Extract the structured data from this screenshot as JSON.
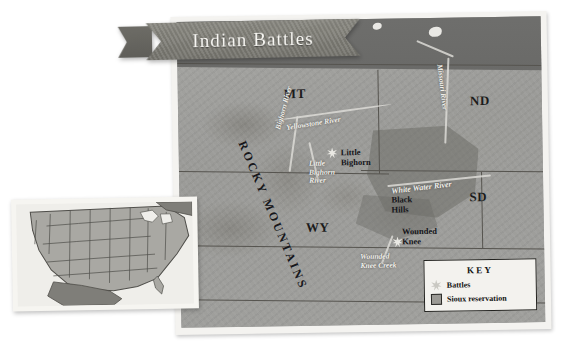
{
  "title": {
    "text": "Indian Battles"
  },
  "map": {
    "states": [
      {
        "name": "MT",
        "label": "MT"
      },
      {
        "name": "ND",
        "label": "ND"
      },
      {
        "name": "SD",
        "label": "SD"
      },
      {
        "name": "WY",
        "label": "WY"
      }
    ],
    "rivers": [
      {
        "name": "yellowstone",
        "label": "Yellowstone River"
      },
      {
        "name": "bighorn",
        "label": "Bighorn River"
      },
      {
        "name": "little-bighorn",
        "label": "Little\nBighorn\nRiver"
      },
      {
        "name": "missouri",
        "label": "Missouri River"
      },
      {
        "name": "white-water",
        "label": "White Water River"
      },
      {
        "name": "wounded-knee-creek",
        "label": "Wounded\nKnee Creek"
      }
    ],
    "places": [
      {
        "name": "little-bighorn",
        "label": "Little\nBighorn"
      },
      {
        "name": "black-hills",
        "label": "Black\nHills"
      },
      {
        "name": "wounded-knee",
        "label": "Wounded\nKnee"
      }
    ],
    "range": {
      "label": "ROCKY MOUNTAINS"
    },
    "colors": {
      "terrain": "#9b9b98",
      "canada": "#6f6f6d",
      "river": "#dcdbd6",
      "reservation": "#6e6d68",
      "border": "#56544f",
      "ribbon": "#7c7b74"
    }
  },
  "key": {
    "title": "KEY",
    "entries": [
      {
        "icon": "starburst-icon",
        "label": "Battles"
      },
      {
        "icon": "square-swatch-icon",
        "label": "Sioux reservation"
      }
    ]
  },
  "inset": {
    "name": "united-states-locator-map",
    "colors": {
      "land": "#a9a8a3",
      "neighbor": "#7f7e79",
      "water": "#efeeea",
      "outline": "#4f4e4a"
    }
  }
}
